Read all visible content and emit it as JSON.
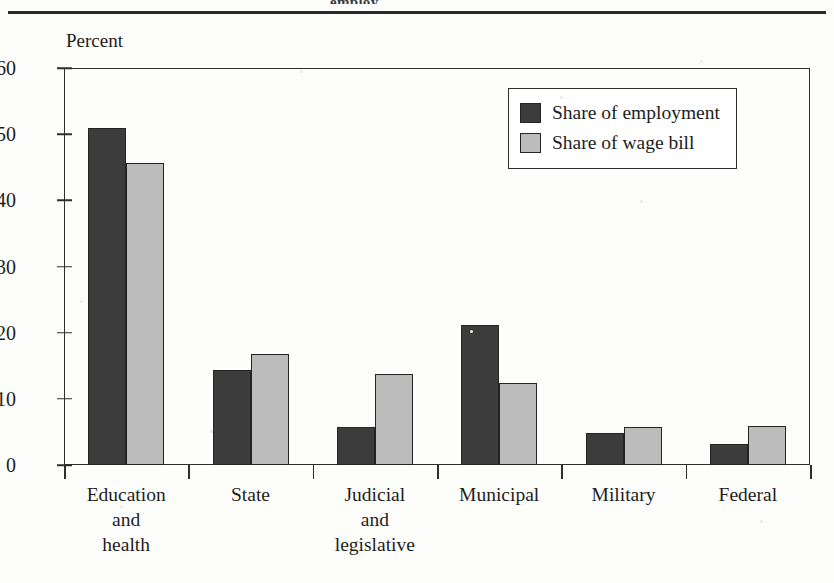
{
  "figure": {
    "clipped_top_caption": "employ",
    "axis_title": "Percent"
  },
  "legend": {
    "items": [
      {
        "label": "Share of employment",
        "swatch": "dark-swatch-icon",
        "color": "#3c3c3c"
      },
      {
        "label": "Share of wage bill",
        "swatch": "light-swatch-icon",
        "color": "#bcbcbc"
      }
    ]
  },
  "chart_data": {
    "type": "bar",
    "title": "",
    "subtitle": "",
    "xlabel": "",
    "ylabel": "Percent",
    "ylim": [
      0,
      60
    ],
    "yticks": [
      0,
      10,
      20,
      30,
      40,
      50,
      60
    ],
    "ytick_labels": [
      "0",
      "10",
      "20",
      "30",
      "40",
      "50",
      "60"
    ],
    "grid": false,
    "legend_position": "upper right",
    "categories": [
      "Education\nand\nhealth",
      "State",
      "Judicial\nand\nlegislative",
      "Municipal",
      "Military",
      "Federal"
    ],
    "series": [
      {
        "name": "Share of employment",
        "color": "#3c3c3c",
        "values": [
          51.0,
          14.3,
          5.7,
          21.2,
          4.9,
          3.2
        ]
      },
      {
        "name": "Share of wage bill",
        "color": "#bcbcbc",
        "values": [
          45.6,
          16.8,
          13.7,
          12.4,
          5.8,
          5.9
        ]
      }
    ]
  }
}
